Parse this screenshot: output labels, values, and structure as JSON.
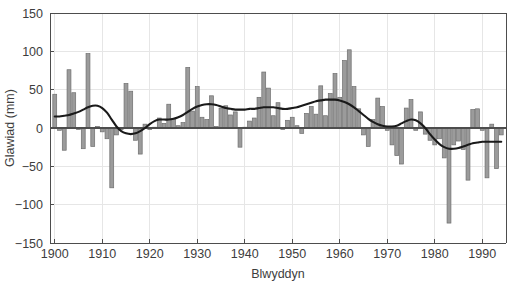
{
  "chart_data": {
    "type": "bar",
    "title": "",
    "subtitle": "",
    "xlabel": "Blwyddyn",
    "ylabel": "Glawiad (mm)",
    "xlim": [
      1899,
      1995
    ],
    "ylim": [
      -150,
      150
    ],
    "xticks": [
      1900,
      1910,
      1920,
      1930,
      1940,
      1950,
      1960,
      1970,
      1980,
      1990
    ],
    "yticks": [
      -150,
      -100,
      -50,
      0,
      50,
      100,
      150
    ],
    "xticklabels": [
      "1900",
      "1910",
      "1920",
      "1930",
      "1940",
      "1950",
      "1960",
      "1970",
      "1980",
      "1990"
    ],
    "yticklabels": [
      "-150",
      "-100",
      "-50",
      "0",
      "50",
      "100",
      "150"
    ],
    "grid": true,
    "legend": false,
    "bar_color": "#9b9b9b",
    "bar_edge_color": "#6e6e6e",
    "line_color": "#1a1a1a",
    "axis_color": "#4d4d4d",
    "grid_color": "#e6e6e6",
    "background_color": "#ffffff",
    "x": [
      1900,
      1901,
      1902,
      1903,
      1904,
      1905,
      1906,
      1907,
      1908,
      1909,
      1910,
      1911,
      1912,
      1913,
      1914,
      1915,
      1916,
      1917,
      1918,
      1919,
      1920,
      1921,
      1922,
      1923,
      1924,
      1925,
      1926,
      1927,
      1928,
      1929,
      1930,
      1931,
      1932,
      1933,
      1934,
      1935,
      1936,
      1937,
      1938,
      1939,
      1940,
      1941,
      1942,
      1943,
      1944,
      1945,
      1946,
      1947,
      1948,
      1949,
      1950,
      1951,
      1952,
      1953,
      1954,
      1955,
      1956,
      1957,
      1958,
      1959,
      1960,
      1961,
      1962,
      1963,
      1964,
      1965,
      1966,
      1967,
      1968,
      1969,
      1970,
      1971,
      1972,
      1973,
      1974,
      1975,
      1976,
      1977,
      1978,
      1979,
      1980,
      1981,
      1982,
      1983,
      1984,
      1985,
      1986,
      1987,
      1988,
      1989,
      1990,
      1991,
      1992,
      1993,
      1994
    ],
    "series": [
      {
        "name": "Glawiad blynyddol (gwyriad)",
        "type": "bar",
        "values": [
          44,
          -3,
          -29,
          76,
          46,
          -2,
          -27,
          97,
          -24,
          2,
          -5,
          -14,
          -78,
          -9,
          -2,
          58,
          48,
          -16,
          -34,
          5,
          -2,
          1,
          13,
          6,
          31,
          12,
          3,
          7,
          79,
          22,
          54,
          14,
          11,
          42,
          2,
          26,
          29,
          17,
          21,
          -25,
          1,
          9,
          13,
          40,
          73,
          52,
          16,
          33,
          -2,
          10,
          14,
          3,
          -7,
          19,
          28,
          18,
          55,
          16,
          45,
          71,
          40,
          88,
          102,
          54,
          25,
          -9,
          -24,
          11,
          39,
          28,
          -3,
          -22,
          -36,
          -47,
          26,
          37,
          -3,
          21,
          -8,
          -16,
          -22,
          -14,
          -39,
          -124,
          -22,
          -17,
          -28,
          -68,
          24,
          25,
          -3,
          -65,
          5,
          -53,
          -9
        ]
      },
      {
        "name": "Tuedd lyfnhau",
        "type": "line",
        "values": [
          15,
          15,
          16,
          17,
          19,
          21,
          24,
          27,
          29,
          29,
          26,
          20,
          11,
          2,
          -4,
          -7,
          -8,
          -7,
          -4,
          0,
          5,
          9,
          11,
          11,
          11,
          12,
          14,
          17,
          21,
          25,
          28,
          30,
          31,
          31,
          30,
          28,
          26,
          25,
          24,
          24,
          24,
          25,
          25,
          26,
          27,
          27,
          27,
          26,
          25,
          25,
          26,
          27,
          29,
          31,
          33,
          35,
          36,
          37,
          37,
          37,
          36,
          34,
          31,
          27,
          22,
          17,
          12,
          8,
          5,
          3,
          2,
          2,
          3,
          6,
          9,
          11,
          10,
          6,
          0,
          -8,
          -15,
          -21,
          -25,
          -27,
          -27,
          -26,
          -24,
          -22,
          -20,
          -19,
          -18,
          -18,
          -18,
          -18,
          -18
        ]
      }
    ]
  },
  "plot_geometry": {
    "left": 50,
    "top": 13,
    "width": 456,
    "height": 230
  }
}
